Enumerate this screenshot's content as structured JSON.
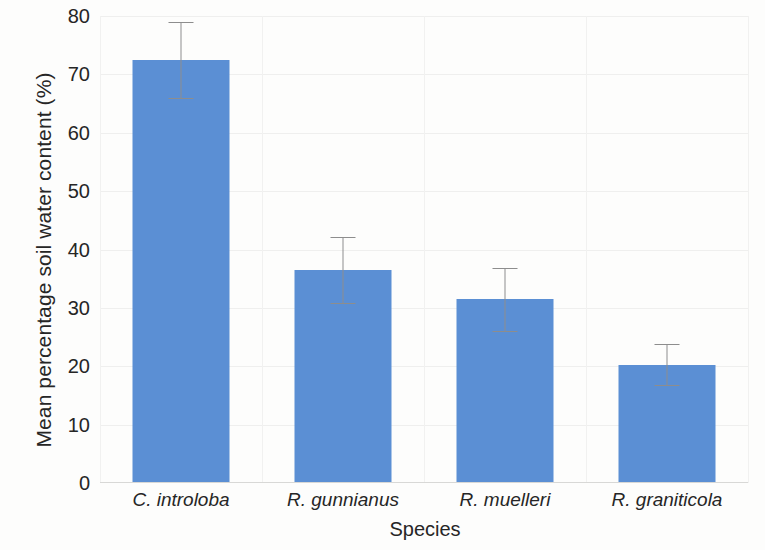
{
  "chart_data": {
    "type": "bar",
    "title": "",
    "subtitle": "",
    "xlabel": "Species",
    "ylabel": "Mean percentage soil water content (%)",
    "categories": [
      "C. introloba",
      "R. gunnianus",
      "R. muelleri",
      "R. graniticola"
    ],
    "values": [
      72.5,
      36.5,
      31.5,
      20.3
    ],
    "errors": [
      6.5,
      5.7,
      5.4,
      3.5
    ],
    "error_type": "symmetric",
    "ylim": [
      0,
      80
    ],
    "ytick_labels": [
      "80",
      "70",
      "60",
      "50",
      "40",
      "30",
      "20",
      "10",
      "0"
    ],
    "ytick_values": [
      80,
      70,
      60,
      50,
      40,
      30,
      20,
      10,
      0
    ],
    "grid": true,
    "grid_axis": "both",
    "legend": false,
    "legend_position": "none",
    "bar_color": "#5B8FD4",
    "error_color": "#8D8D8D",
    "background_color": "#FDFDFC",
    "axis_color": "#D8D8D6",
    "text_color": "#262626",
    "xtick_style": "italic",
    "annotations": []
  }
}
